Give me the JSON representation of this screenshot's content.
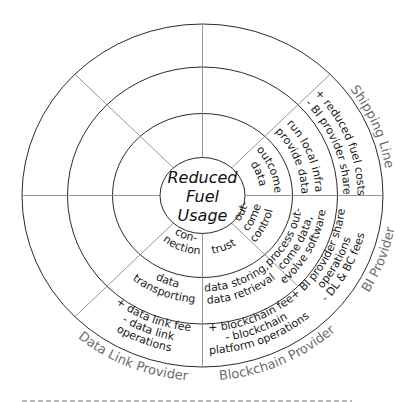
{
  "diagram": {
    "type": "stakeholder-value-wheel",
    "center_label": [
      "Reduced",
      "Fuel",
      "Usage"
    ],
    "colors": {
      "ring_stroke": "#2b2b2b",
      "spoke_stroke": "#8a8a8a",
      "text": "#1a1a1a",
      "stakeholder_text": "#6e6e6e",
      "background": "#ffffff"
    },
    "rings": [
      "value / activity (inner)",
      "activity (middle)",
      "costs & benefits (outer)"
    ],
    "stakeholders": [
      {
        "name": "Shipping Line",
        "angle": -22
      },
      {
        "name": "BI Provider",
        "angle": 20
      },
      {
        "name": "Blockchain Provider",
        "angle": 65
      },
      {
        "name": "Data Link Provider",
        "angle": 113
      }
    ],
    "segments": [
      {
        "stakeholder": "Shipping Line",
        "inner": [
          "outcome",
          "data"
        ],
        "middle": [
          "run local infra",
          "provide data"
        ],
        "outer": [
          "+ reduced fuel costs",
          "- BI provider share"
        ]
      },
      {
        "stakeholder": "BI Provider",
        "inner": [
          "out-",
          "come",
          "control"
        ],
        "middle": [
          "process out-",
          "come data,",
          "evolve software"
        ],
        "outer": [
          "+ BI provider share",
          "operations",
          "- DL & BC fees"
        ]
      },
      {
        "stakeholder": "Blockchain Provider",
        "inner": [
          "trust"
        ],
        "middle": [
          "data storing,",
          "data retrieval"
        ],
        "outer": [
          "+ blockchain fee",
          "- blockchain",
          "platform operations"
        ]
      },
      {
        "stakeholder": "Data Link Provider",
        "inner": [
          "con-",
          "nection"
        ],
        "middle": [
          "data",
          "transporting"
        ],
        "outer": [
          "+ data link fee",
          "- data link",
          "operations"
        ]
      }
    ]
  }
}
